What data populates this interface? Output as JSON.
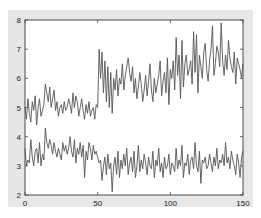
{
  "colors": {
    "figure_bg": "#e7e7e7",
    "axes_bg": "#ffffff",
    "frame": "#4a4a4a",
    "line": "#555555"
  },
  "chart_data": {
    "type": "line",
    "title": "",
    "xlabel": "",
    "ylabel": "",
    "xlim": [
      0,
      150
    ],
    "ylim": [
      2,
      8
    ],
    "grid": false,
    "legend": null,
    "x_ticks": [
      0,
      50,
      100,
      150
    ],
    "y_ticks": [
      2,
      3,
      4,
      5,
      6,
      7,
      8
    ],
    "x_tick_labels": [
      "0",
      "50",
      "100",
      "150"
    ],
    "y_tick_labels": [
      "2",
      "3",
      "4",
      "5",
      "6",
      "7",
      "8"
    ],
    "series": [
      {
        "name": "upper",
        "values": [
          5.0,
          4.6,
          5.3,
          4.8,
          4.5,
          5.2,
          4.9,
          5.4,
          4.4,
          5.0,
          5.3,
          4.7,
          4.9,
          5.1,
          5.8,
          5.5,
          5.2,
          5.7,
          5.0,
          5.3,
          5.6,
          4.9,
          5.2,
          4.7,
          5.0,
          5.1,
          4.8,
          5.2,
          4.9,
          5.0,
          5.3,
          5.1,
          4.8,
          5.5,
          5.0,
          5.4,
          5.2,
          4.7,
          5.0,
          5.3,
          4.9,
          4.6,
          5.1,
          4.8,
          5.2,
          4.7,
          4.9,
          5.0,
          4.6,
          5.1,
          5.0,
          7.0,
          6.0,
          6.9,
          5.5,
          6.6,
          5.2,
          6.4,
          5.0,
          6.2,
          4.8,
          6.0,
          5.6,
          6.3,
          5.4,
          6.0,
          5.8,
          6.5,
          5.6,
          6.1,
          6.4,
          6.7,
          6.2,
          5.9,
          6.4,
          5.5,
          6.0,
          5.3,
          5.7,
          6.2,
          5.8,
          5.2,
          5.6,
          6.1,
          5.4,
          5.9,
          6.5,
          5.6,
          5.2,
          6.0,
          5.5,
          5.8,
          6.1,
          6.6,
          5.4,
          5.9,
          6.2,
          5.5,
          6.7,
          5.1,
          6.3,
          6.0,
          6.6,
          5.6,
          7.4,
          6.1,
          6.8,
          5.3,
          7.3,
          5.7,
          6.5,
          6.8,
          6.1,
          6.3,
          6.6,
          5.8,
          7.6,
          6.2,
          7.5,
          5.5,
          6.8,
          6.4,
          6.0,
          6.9,
          7.2,
          6.3,
          5.9,
          6.6,
          7.0,
          7.8,
          6.1,
          6.5,
          7.1,
          6.9,
          6.4,
          7.9,
          6.6,
          6.1,
          6.8,
          6.3,
          7.3,
          6.7,
          6.4,
          6.2,
          6.9,
          5.8,
          6.7,
          6.5,
          6.3,
          6.0,
          6.5
        ],
        "note": "Approximate trace: ~4.5-5.8 for x 0-50, step up to ~5-7 for x 50-100, ~5.5-8 for x 100-150"
      },
      {
        "name": "lower",
        "values": [
          3.6,
          3.0,
          3.2,
          3.1,
          3.9,
          3.3,
          3.0,
          3.5,
          3.6,
          3.1,
          3.8,
          3.0,
          3.4,
          3.2,
          4.3,
          3.8,
          3.6,
          3.9,
          3.7,
          3.4,
          3.8,
          3.5,
          3.3,
          3.6,
          3.4,
          3.2,
          3.8,
          3.5,
          3.7,
          3.4,
          3.6,
          4.0,
          3.5,
          3.3,
          3.9,
          3.1,
          3.6,
          3.4,
          3.8,
          3.3,
          3.7,
          2.6,
          3.5,
          3.2,
          3.8,
          3.6,
          3.2,
          3.7,
          3.4,
          3.5,
          3.3,
          3.1,
          3.2,
          2.5,
          3.0,
          3.3,
          2.7,
          3.4,
          2.9,
          3.1,
          2.1,
          3.0,
          3.3,
          2.7,
          3.5,
          2.6,
          3.2,
          2.9,
          3.4,
          3.0,
          3.6,
          2.7,
          3.1,
          3.3,
          2.8,
          3.5,
          2.6,
          3.0,
          3.7,
          2.8,
          3.2,
          2.9,
          3.4,
          3.1,
          2.7,
          3.3,
          3.0,
          2.9,
          3.5,
          2.6,
          3.2,
          3.0,
          3.6,
          2.8,
          3.1,
          2.6,
          3.3,
          2.9,
          3.0,
          3.4,
          2.7,
          3.1,
          3.0,
          2.8,
          3.6,
          2.9,
          3.2,
          3.0,
          3.7,
          2.6,
          3.1,
          3.0,
          3.4,
          2.7,
          3.2,
          3.3,
          2.9,
          3.8,
          3.0,
          2.8,
          3.5,
          2.4,
          3.2,
          3.1,
          3.3,
          2.9,
          3.0,
          3.4,
          3.1,
          2.8,
          3.3,
          3.0,
          3.6,
          2.9,
          3.2,
          3.1,
          3.4,
          3.0,
          3.8,
          3.1,
          3.3,
          2.9,
          3.5,
          3.2,
          3.0,
          2.7,
          3.4,
          3.1,
          2.6,
          3.3,
          3.5
        ],
        "note": "Approximate trace: ~3-4.3 for x 0-50, ~2-3.8 for x 50-150"
      }
    ]
  }
}
